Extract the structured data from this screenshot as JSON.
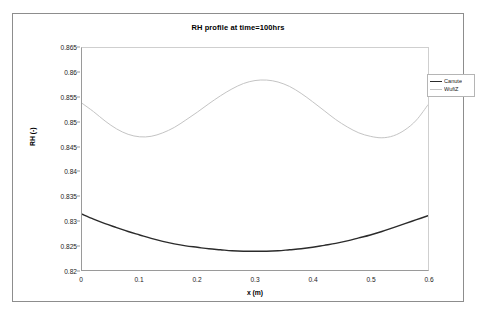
{
  "chart_data": {
    "type": "line",
    "title": "RH profile at time=100hrs",
    "xlabel": "x (m)",
    "ylabel": "RH (-)",
    "xlim": [
      0,
      0.6
    ],
    "ylim": [
      0.82,
      0.865
    ],
    "xticks": [
      "0",
      "0.1",
      "0.2",
      "0.3",
      "0.4",
      "0.5",
      "0.6"
    ],
    "xtick_values": [
      0,
      0.1,
      0.2,
      0.3,
      0.4,
      0.5,
      0.6
    ],
    "yticks": [
      "0.865",
      "0.86",
      "0.855",
      "0.85",
      "0.845",
      "0.84",
      "0.835",
      "0.83",
      "0.825",
      "0.82"
    ],
    "ytick_values": [
      0.865,
      0.86,
      0.855,
      0.85,
      0.845,
      0.84,
      0.835,
      0.83,
      0.825,
      0.82
    ],
    "grid": false,
    "legend_position": "right",
    "series": [
      {
        "name": "Canute",
        "color": "#2b2b2b",
        "width": 1.4,
        "x": [
          0,
          0.02,
          0.04,
          0.06,
          0.08,
          0.1,
          0.12,
          0.14,
          0.16,
          0.18,
          0.2,
          0.22,
          0.24,
          0.26,
          0.28,
          0.3,
          0.32,
          0.34,
          0.36,
          0.38,
          0.4,
          0.42,
          0.44,
          0.46,
          0.48,
          0.5,
          0.52,
          0.54,
          0.56,
          0.58,
          0.6
        ],
        "values": [
          0.8313,
          0.8303,
          0.8294,
          0.8286,
          0.8278,
          0.8271,
          0.8264,
          0.8258,
          0.8253,
          0.8249,
          0.8246,
          0.8243,
          0.8241,
          0.8239,
          0.8238,
          0.8238,
          0.8238,
          0.8239,
          0.8241,
          0.8243,
          0.8246,
          0.825,
          0.8254,
          0.8259,
          0.8265,
          0.8271,
          0.8278,
          0.8286,
          0.8294,
          0.8302,
          0.831
        ]
      },
      {
        "name": "WufiZ",
        "color": "#c4c4c4",
        "width": 1.0,
        "x": [
          0,
          0.02,
          0.04,
          0.06,
          0.08,
          0.1,
          0.12,
          0.14,
          0.16,
          0.18,
          0.2,
          0.22,
          0.24,
          0.26,
          0.28,
          0.3,
          0.32,
          0.34,
          0.36,
          0.38,
          0.4,
          0.42,
          0.44,
          0.46,
          0.48,
          0.5,
          0.52,
          0.54,
          0.56,
          0.58,
          0.6
        ],
        "values": [
          0.8538,
          0.8521,
          0.8502,
          0.8486,
          0.8475,
          0.847,
          0.8471,
          0.8478,
          0.8489,
          0.8504,
          0.852,
          0.8537,
          0.8553,
          0.8567,
          0.8578,
          0.8584,
          0.8585,
          0.8581,
          0.8572,
          0.8558,
          0.8541,
          0.8523,
          0.8505,
          0.849,
          0.8478,
          0.8471,
          0.8468,
          0.8472,
          0.8484,
          0.8504,
          0.8535
        ]
      }
    ]
  },
  "legend": {
    "entries": [
      {
        "label": "Canute",
        "color": "#2b2b2b"
      },
      {
        "label": "WufiZ",
        "color": "#c4c4c4"
      }
    ]
  }
}
